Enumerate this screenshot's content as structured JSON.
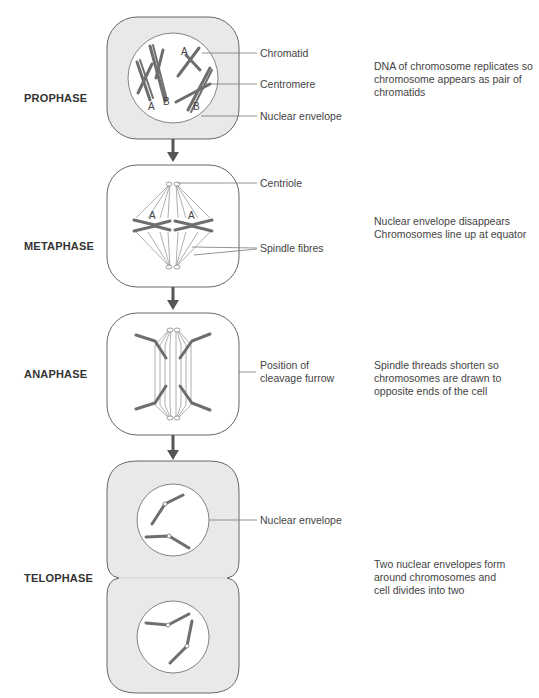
{
  "phases": [
    {
      "name": "PROPHASE",
      "description": "DNA of chromosome replicates so chromosome appears as pair of chromatids",
      "callouts": [
        "Chromatid",
        "Centromere",
        "Nuclear envelope"
      ],
      "chromosome_labels": [
        "A",
        "B",
        "A",
        "B"
      ]
    },
    {
      "name": "METAPHASE",
      "description_lines": [
        "Nuclear envelope disappears",
        "Chromosomes line up at equator"
      ],
      "callouts": [
        "Centriole",
        "Spindle fibres"
      ],
      "chromosome_labels": [
        "A",
        "A"
      ]
    },
    {
      "name": "ANAPHASE",
      "description": "Spindle threads shorten so chromosomes are drawn to opposite ends of the cell",
      "callouts": [
        "Position of cleavage furrow"
      ]
    },
    {
      "name": "TELOPHASE",
      "description": "Two nuclear envelopes form around chromosomes and cell divides into two",
      "callouts": [
        "Nuclear envelope"
      ]
    }
  ],
  "colors": {
    "cell_fill": "#e9e9e9",
    "cell_stroke": "#666666",
    "chromosome": "#6e6e6e",
    "arrow": "#555555",
    "spindle": "#9a9a9a"
  }
}
